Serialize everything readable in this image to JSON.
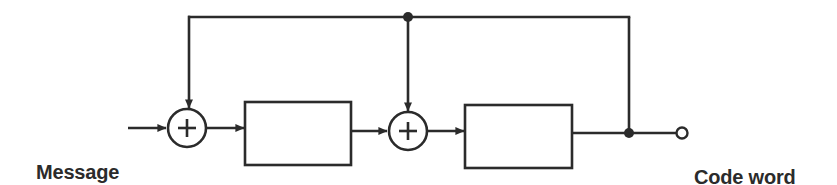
{
  "diagram": {
    "stroke_color": "#2b2b2b",
    "fill_color": "#ffffff",
    "background": "#ffffff",
    "labels": {
      "input": {
        "line1": "Message",
        "line2": "in"
      },
      "output": {
        "line1": "Code word",
        "line2": "out"
      }
    },
    "adders": [
      {
        "id": "adder-1",
        "symbol": "+",
        "cx": 187,
        "cy": 128,
        "r": 19
      },
      {
        "id": "adder-2",
        "symbol": "+",
        "cx": 408,
        "cy": 131,
        "r": 19
      }
    ],
    "blocks": [
      {
        "id": "block-1",
        "label": "",
        "x": 245,
        "y": 102,
        "w": 106,
        "h": 63
      },
      {
        "id": "block-2",
        "label": "",
        "x": 465,
        "y": 105,
        "w": 107,
        "h": 63
      }
    ],
    "junctions": [
      {
        "id": "junction-top-tap",
        "cx": 408,
        "cy": 17,
        "r": 5
      },
      {
        "id": "junction-output-tap",
        "cx": 629,
        "cy": 133,
        "r": 5
      }
    ],
    "terminals": [
      {
        "id": "terminal-output",
        "cx": 682,
        "cy": 133,
        "r": 5.5,
        "style": "open"
      }
    ]
  }
}
